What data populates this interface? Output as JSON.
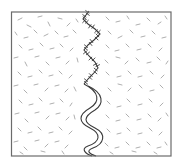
{
  "diagram": {
    "width": 183,
    "height": 166,
    "background": "#ffffff",
    "box": {
      "x": 11.5,
      "y": 12,
      "w": 159.5,
      "h": 144,
      "stroke": "#6b6b6b",
      "stroke_width": 1.2
    },
    "fiber_color": "#a6a6a6",
    "fiber_width": 0.9,
    "crack_color": "#3a3a3a",
    "jagged_crack": {
      "points": [
        [
          89,
          11
        ],
        [
          86,
          15
        ],
        [
          83,
          19
        ],
        [
          88,
          24
        ],
        [
          95,
          29
        ],
        [
          100,
          34
        ],
        [
          94,
          40
        ],
        [
          88,
          45
        ],
        [
          84,
          50
        ],
        [
          89,
          56
        ],
        [
          95,
          62
        ],
        [
          98,
          68
        ],
        [
          93,
          74
        ],
        [
          88,
          79
        ],
        [
          84,
          84
        ]
      ],
      "tick_length": 3.2
    },
    "wavy_channel": {
      "left_path": "M84,84 C100,92 100,102 90,108 C78,115 78,122 90,128 C102,134 100,142 88,146 C80,149 86,154 92,156",
      "right_path": "M88,86 C104,93 104,104 95,110 C83,117 83,122 95,128 C107,134 104,144 93,148 C85,151 90,154 96,156"
    },
    "fibers": [
      [
        18,
        20,
        22,
        18
      ],
      [
        27,
        25,
        31,
        27
      ],
      [
        38,
        17,
        42,
        16
      ],
      [
        48,
        22,
        50,
        26
      ],
      [
        58,
        18,
        62,
        19
      ],
      [
        67,
        26,
        70,
        23
      ],
      [
        76,
        19,
        78,
        22
      ],
      [
        106,
        17,
        109,
        20
      ],
      [
        116,
        22,
        120,
        21
      ],
      [
        127,
        16,
        129,
        19
      ],
      [
        136,
        25,
        140,
        24
      ],
      [
        147,
        18,
        150,
        21
      ],
      [
        158,
        24,
        161,
        22
      ],
      [
        165,
        16,
        167,
        19
      ],
      [
        15,
        32,
        17,
        35
      ],
      [
        24,
        38,
        28,
        37
      ],
      [
        34,
        30,
        37,
        33
      ],
      [
        44,
        36,
        48,
        34
      ],
      [
        55,
        31,
        58,
        34
      ],
      [
        64,
        37,
        68,
        36
      ],
      [
        73,
        30,
        76,
        33
      ],
      [
        108,
        31,
        111,
        34
      ],
      [
        118,
        38,
        122,
        36
      ],
      [
        130,
        30,
        133,
        33
      ],
      [
        141,
        37,
        145,
        36
      ],
      [
        152,
        31,
        155,
        34
      ],
      [
        162,
        38,
        166,
        37
      ],
      [
        19,
        45,
        22,
        48
      ],
      [
        29,
        50,
        33,
        49
      ],
      [
        40,
        43,
        43,
        46
      ],
      [
        50,
        49,
        54,
        48
      ],
      [
        60,
        44,
        63,
        47
      ],
      [
        70,
        51,
        73,
        48
      ],
      [
        106,
        45,
        109,
        48
      ],
      [
        115,
        51,
        119,
        50
      ],
      [
        126,
        44,
        129,
        47
      ],
      [
        137,
        50,
        141,
        49
      ],
      [
        148,
        44,
        151,
        47
      ],
      [
        159,
        51,
        162,
        48
      ],
      [
        14,
        58,
        18,
        57
      ],
      [
        25,
        62,
        27,
        66
      ],
      [
        35,
        57,
        39,
        56
      ],
      [
        46,
        62,
        49,
        65
      ],
      [
        56,
        58,
        60,
        57
      ],
      [
        66,
        64,
        69,
        61
      ],
      [
        77,
        58,
        78,
        62
      ],
      [
        105,
        60,
        108,
        63
      ],
      [
        116,
        57,
        120,
        58
      ],
      [
        125,
        64,
        128,
        61
      ],
      [
        136,
        58,
        139,
        61
      ],
      [
        147,
        63,
        151,
        62
      ],
      [
        157,
        57,
        160,
        60
      ],
      [
        166,
        64,
        168,
        61
      ],
      [
        18,
        72,
        21,
        75
      ],
      [
        28,
        77,
        32,
        76
      ],
      [
        39,
        70,
        42,
        73
      ],
      [
        49,
        76,
        53,
        75
      ],
      [
        59,
        71,
        62,
        74
      ],
      [
        69,
        78,
        72,
        75
      ],
      [
        106,
        72,
        109,
        75
      ],
      [
        117,
        77,
        121,
        76
      ],
      [
        128,
        71,
        131,
        74
      ],
      [
        138,
        77,
        142,
        76
      ],
      [
        150,
        71,
        153,
        74
      ],
      [
        161,
        78,
        164,
        75
      ],
      [
        14,
        86,
        18,
        85
      ],
      [
        24,
        90,
        27,
        93
      ],
      [
        34,
        85,
        38,
        84
      ],
      [
        45,
        91,
        48,
        88
      ],
      [
        55,
        86,
        59,
        85
      ],
      [
        65,
        92,
        68,
        89
      ],
      [
        74,
        87,
        76,
        91
      ],
      [
        108,
        88,
        111,
        91
      ],
      [
        118,
        84,
        122,
        85
      ],
      [
        128,
        91,
        131,
        88
      ],
      [
        139,
        85,
        142,
        88
      ],
      [
        150,
        91,
        154,
        90
      ],
      [
        160,
        85,
        163,
        88
      ],
      [
        19,
        100,
        22,
        103
      ],
      [
        29,
        105,
        33,
        104
      ],
      [
        39,
        98,
        42,
        101
      ],
      [
        50,
        104,
        54,
        103
      ],
      [
        60,
        99,
        63,
        102
      ],
      [
        70,
        106,
        72,
        103
      ],
      [
        107,
        101,
        110,
        104
      ],
      [
        117,
        107,
        121,
        106
      ],
      [
        127,
        99,
        130,
        102
      ],
      [
        138,
        105,
        142,
        104
      ],
      [
        149,
        99,
        152,
        102
      ],
      [
        160,
        106,
        163,
        103
      ],
      [
        15,
        114,
        19,
        113
      ],
      [
        25,
        119,
        28,
        122
      ],
      [
        35,
        113,
        39,
        112
      ],
      [
        46,
        119,
        49,
        116
      ],
      [
        56,
        114,
        60,
        113
      ],
      [
        66,
        120,
        69,
        117
      ],
      [
        74,
        115,
        75,
        119
      ],
      [
        106,
        115,
        109,
        118
      ],
      [
        116,
        121,
        120,
        120
      ],
      [
        126,
        114,
        129,
        117
      ],
      [
        137,
        120,
        141,
        119
      ],
      [
        148,
        114,
        151,
        117
      ],
      [
        158,
        121,
        161,
        118
      ],
      [
        166,
        113,
        168,
        116
      ],
      [
        18,
        128,
        21,
        131
      ],
      [
        28,
        133,
        32,
        132
      ],
      [
        38,
        127,
        41,
        130
      ],
      [
        49,
        133,
        53,
        132
      ],
      [
        59,
        127,
        62,
        130
      ],
      [
        69,
        134,
        72,
        131
      ],
      [
        107,
        129,
        110,
        132
      ],
      [
        117,
        134,
        121,
        133
      ],
      [
        127,
        128,
        130,
        131
      ],
      [
        138,
        134,
        142,
        133
      ],
      [
        149,
        128,
        152,
        131
      ],
      [
        159,
        135,
        162,
        132
      ],
      [
        14,
        142,
        18,
        141
      ],
      [
        24,
        147,
        27,
        150
      ],
      [
        35,
        141,
        39,
        140
      ],
      [
        45,
        147,
        48,
        144
      ],
      [
        55,
        142,
        59,
        141
      ],
      [
        65,
        148,
        68,
        145
      ],
      [
        105,
        143,
        108,
        146
      ],
      [
        115,
        148,
        119,
        147
      ],
      [
        126,
        142,
        129,
        145
      ],
      [
        136,
        148,
        140,
        147
      ],
      [
        147,
        142,
        150,
        145
      ],
      [
        157,
        148,
        161,
        147
      ],
      [
        165,
        142,
        167,
        145
      ],
      [
        20,
        152,
        23,
        154
      ],
      [
        41,
        151,
        45,
        152
      ],
      [
        62,
        151,
        64,
        154
      ],
      [
        110,
        152,
        113,
        154
      ],
      [
        132,
        151,
        136,
        152
      ],
      [
        154,
        152,
        157,
        154
      ]
    ]
  }
}
